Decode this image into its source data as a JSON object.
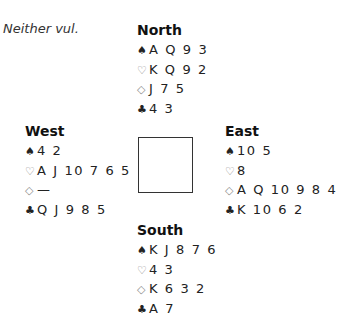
{
  "header": {
    "vulnerability": "Neither vul."
  },
  "suit_icons": {
    "spades": "♠",
    "hearts": "♡",
    "diamonds": "◇",
    "clubs": "♣"
  },
  "hands": {
    "north": {
      "title": "North",
      "spades": "A Q 9 3",
      "hearts": "K Q 9 2",
      "diamonds": "J 7 5",
      "clubs": "4 3"
    },
    "west": {
      "title": "West",
      "spades": "4 2",
      "hearts": "A J 10 7 6 5",
      "diamonds": "—",
      "clubs": "Q J 9 8 5"
    },
    "east": {
      "title": "East",
      "spades": "10 5",
      "hearts": "8",
      "diamonds": "A Q 10 9 8 4",
      "clubs": "K 10 6 2"
    },
    "south": {
      "title": "South",
      "spades": "K J 8 7 6",
      "hearts": "4 3",
      "diamonds": "K 6 3 2",
      "clubs": "A 7"
    }
  }
}
